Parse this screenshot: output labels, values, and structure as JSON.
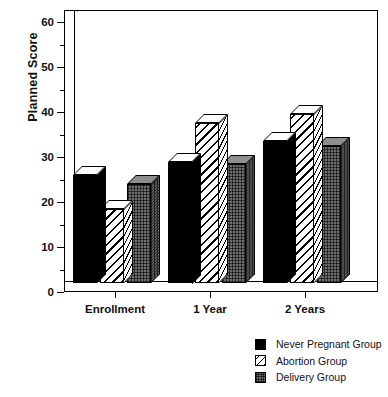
{
  "chart_data": {
    "type": "bar",
    "title": "",
    "xlabel": "",
    "ylabel": "Planned Score",
    "categories": [
      "Enrollment",
      "1 Year",
      "2 Years"
    ],
    "series": [
      {
        "name": "Never Pregnant Group",
        "pattern": "solid-black",
        "color": "#000000",
        "values": [
          24,
          27,
          31.5
        ]
      },
      {
        "name": "Abortion Group",
        "pattern": "diagonal-hatch",
        "color": "#ffffff",
        "values": [
          16.5,
          35.5,
          37.5
        ]
      },
      {
        "name": "Delivery Group",
        "pattern": "gray-dotted",
        "color": "#6e6e6e",
        "values": [
          22,
          26.5,
          30.5
        ]
      }
    ],
    "ylim": [
      0,
      60
    ],
    "yticks": [
      0,
      10,
      20,
      30,
      40,
      50,
      60
    ],
    "ytick_labels": [
      "0",
      "10",
      "20",
      "30",
      "40",
      "50",
      "60"
    ],
    "yminor_step": 5,
    "grid": false,
    "legend_position": "bottom-right",
    "style": "3d-bars"
  },
  "axis": {
    "y_title": "Planned Score"
  },
  "legend": {
    "entries": [
      {
        "label": "Never Pregnant Group"
      },
      {
        "label": "Abortion Group"
      },
      {
        "label": "Delivery Group"
      }
    ]
  }
}
